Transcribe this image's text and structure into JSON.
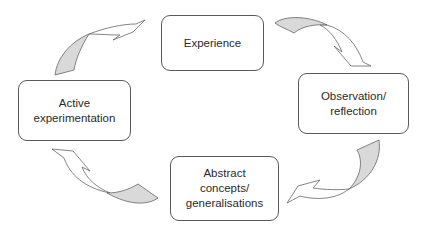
{
  "diagram": {
    "type": "cycle",
    "nodes": [
      {
        "id": "experience",
        "label": "Experience"
      },
      {
        "id": "observation",
        "label": "Observation/\nreflection"
      },
      {
        "id": "abstract",
        "label": "Abstract\nconcepts/\ngeneralisations"
      },
      {
        "id": "active",
        "label": "Active\nexperimentation"
      }
    ],
    "edges": [
      {
        "from": "experience",
        "to": "observation"
      },
      {
        "from": "observation",
        "to": "abstract"
      },
      {
        "from": "abstract",
        "to": "active"
      },
      {
        "from": "active",
        "to": "experience"
      }
    ],
    "colors": {
      "border": "#5a5a5a",
      "arrow_fill": "#d9d9d9",
      "text": "#2a2a2a"
    }
  }
}
